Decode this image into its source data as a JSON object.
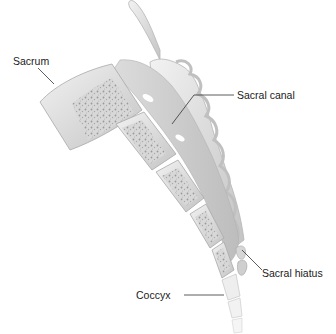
{
  "figure": {
    "labels": [
      {
        "id": "sacrum",
        "text": "Sacrum"
      },
      {
        "id": "sacral-canal",
        "text": "Sacral canal"
      },
      {
        "id": "sacral-hiatus",
        "text": "Sacral hiatus"
      },
      {
        "id": "coccyx",
        "text": "Coccyx"
      }
    ],
    "colors": {
      "background": "#ffffff",
      "bone_cortex": "#e4e4e4",
      "bone_cortex_shadow": "#b8b8b8",
      "cancellous_bone": "#cfcfcf",
      "canal": "#d4d4d4",
      "label_text": "#1a1a1a",
      "leader_line": "#333333"
    }
  }
}
